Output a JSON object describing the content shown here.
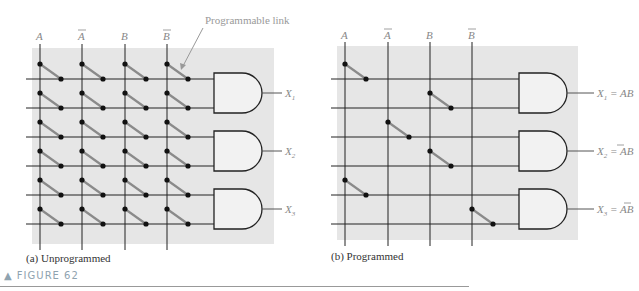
{
  "figure": {
    "label": "▲ FIGURE 62",
    "colors": {
      "panel_bg": "#e6e6e6",
      "line": "#222222",
      "link": "#8a8a8a",
      "label": "#8fa3b0",
      "annotation": "#999999"
    }
  },
  "panels": [
    {
      "id": "a",
      "caption": "(a) Unprogrammed",
      "inputs": [
        "A",
        "Ā",
        "B",
        "B̄"
      ],
      "annotation": "Programmable link",
      "outputs": [
        "X1",
        "X2",
        "X3"
      ],
      "state": "all links intact"
    },
    {
      "id": "b",
      "caption": "(b) Programmed",
      "inputs": [
        "A",
        "Ā",
        "B",
        "B̄"
      ],
      "outputs": [
        "X1 = AB",
        "X2 = ĀB",
        "X3 = AB̄"
      ],
      "links": [
        [
          0,
          0
        ],
        [
          1,
          2
        ],
        [
          2,
          1
        ],
        [
          3,
          2
        ],
        [
          4,
          0
        ],
        [
          5,
          3
        ]
      ]
    }
  ]
}
